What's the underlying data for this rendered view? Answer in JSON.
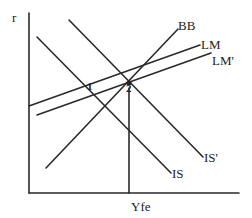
{
  "diagram": {
    "type": "IS-LM-BB macroeconomic diagram",
    "axes": {
      "y_label": "r",
      "x_marker_label": "Yfe"
    },
    "curves": {
      "is": {
        "label": "IS"
      },
      "is_prime": {
        "label": "IS'"
      },
      "lm": {
        "label": "LM"
      },
      "lm_prime": {
        "label": "LM'"
      },
      "bb": {
        "label": "BB"
      }
    },
    "points": {
      "p1": {
        "label": "1"
      },
      "p2": {
        "label": "2"
      }
    },
    "colors": {
      "line": "#2a2a2a",
      "background": "#ffffff"
    }
  }
}
